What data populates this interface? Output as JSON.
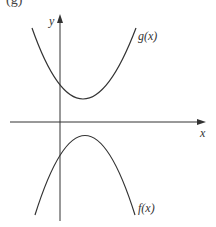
{
  "figure": {
    "panel_label": "(g)",
    "axes": {
      "x_label": "x",
      "y_label": "y"
    },
    "curves": [
      {
        "name": "g",
        "label": "g(x)",
        "shape": "upward parabola",
        "vertex": "above x-axis, right of y-axis"
      },
      {
        "name": "f",
        "label": "f(x)",
        "shape": "downward parabola",
        "vertex": "below x-axis, right of y-axis"
      }
    ],
    "colors": {
      "stroke": "#333333",
      "background": "#ffffff"
    }
  }
}
